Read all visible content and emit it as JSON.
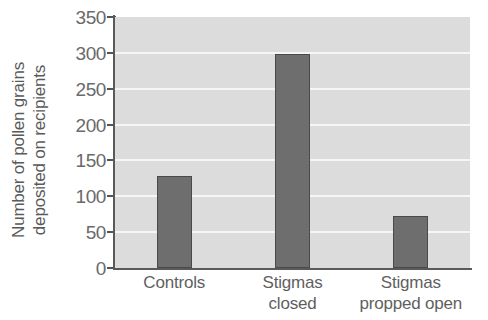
{
  "chart_data": {
    "type": "bar",
    "title": "",
    "xlabel": "",
    "ylabel": "Number of pollen grains deposited on recipients",
    "ylabel_lines": [
      "Number of pollen grains",
      "deposited on recipients"
    ],
    "categories": [
      "Controls",
      "Stigmas closed",
      "Stigmas propped open"
    ],
    "category_lines": [
      [
        "Controls"
      ],
      [
        "Stigmas",
        "closed"
      ],
      [
        "Stigmas",
        "propped open"
      ]
    ],
    "values": [
      128,
      299,
      73
    ],
    "ylim": [
      0,
      350
    ],
    "yticks": [
      0,
      50,
      100,
      150,
      200,
      250,
      300,
      350
    ],
    "ytick_labels": [
      "0",
      "50",
      "100",
      "150",
      "200",
      "250",
      "300",
      "350"
    ],
    "grid": true,
    "grid_axis": "y",
    "legend": null,
    "colors": {
      "bar_fill": "#6e6e6e",
      "bar_edge": "#4a4a4a",
      "plot_background": "#dcdcdc",
      "gridline": "#f6f6f6",
      "axis": "#5a5a5a",
      "text": "#5f5f5f",
      "figure_background": "#ffffff"
    }
  }
}
